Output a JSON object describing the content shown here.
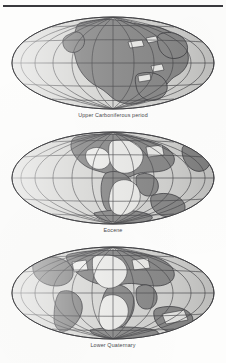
{
  "figure": {
    "top_rule": true,
    "background_color": "#fdfdfc",
    "rule_color": "#39393d"
  },
  "palette": {
    "ocean": "#d8d8d6",
    "land": "#8e8e8e",
    "land_light": "#eeeeec",
    "graticule": "#4a4a4e",
    "outline": "#3c3c40",
    "caption": "#4a4a4e"
  },
  "maps": [
    {
      "id": "map-upper-carboniferous",
      "caption": "Upper Carboniferous period",
      "projection": "Mollweide",
      "graticule": {
        "meridian_count": 13,
        "parallel_count": 5,
        "meridian_spacing_deg": 30,
        "parallel_spacing_deg": 30
      },
      "landmasses": [
        "Pangaea supercontinent",
        "Laurasia (north)",
        "Gondwana (south)"
      ]
    },
    {
      "id": "map-eocene",
      "caption": "Eocene",
      "projection": "Mollweide",
      "graticule": {
        "meridian_count": 13,
        "parallel_count": 5,
        "meridian_spacing_deg": 30,
        "parallel_spacing_deg": 30
      },
      "landmasses": [
        "North America",
        "South America",
        "Eurasia",
        "Africa",
        "India",
        "Australia",
        "Antarctica"
      ]
    },
    {
      "id": "map-lower-quaternary",
      "caption": "Lower Quaternary",
      "projection": "Mollweide",
      "graticule": {
        "meridian_count": 13,
        "parallel_count": 5,
        "meridian_spacing_deg": 30,
        "parallel_spacing_deg": 30
      },
      "landmasses": [
        "North America",
        "South America",
        "Eurasia",
        "Africa",
        "India",
        "Australia",
        "Antarctica"
      ]
    }
  ]
}
